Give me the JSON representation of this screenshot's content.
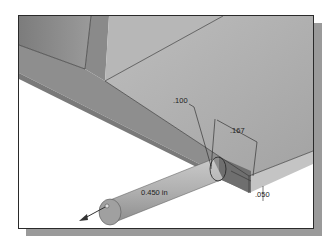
{
  "viewport": {
    "type": "3d-cad-model-view",
    "background": "#ffffff",
    "frame_border_color": "#2a2a2a",
    "shadow_color": "#9a9a9a"
  },
  "model": {
    "colors": {
      "top_face": "#a9a9a9",
      "side_face": "#8c8c8c",
      "dark_face": "#7a7a7a",
      "cylinder": "#b3b3b3",
      "cylinder_end": "#9a9a9a"
    }
  },
  "dimensions": {
    "radius_label": ".100",
    "width_label": ".167",
    "offset_label": ".050",
    "extrude_distance_label": "0.450 in"
  },
  "icons": {
    "direction_arrow": "extrude-direction-arrow-icon"
  }
}
